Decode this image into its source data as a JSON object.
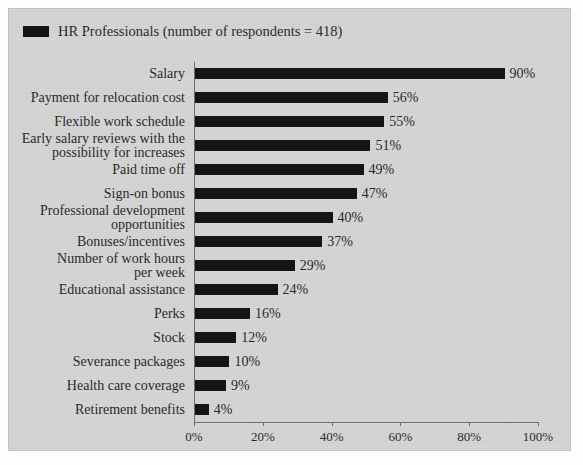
{
  "legend": {
    "swatch_color": "#141414",
    "label": "HR Professionals (number of respondents = 418)"
  },
  "chart_data": {
    "type": "bar",
    "orientation": "horizontal",
    "title": "",
    "subtitle": "",
    "xlabel": "",
    "ylabel": "",
    "xlim": [
      0,
      100
    ],
    "grid": false,
    "legend_position": "top-left",
    "xticks": [
      0,
      20,
      40,
      60,
      80,
      100
    ],
    "xticklabels": [
      "0%",
      "20%",
      "40%",
      "60%",
      "80%",
      "100%"
    ],
    "value_label_suffix": "%",
    "bar_color": "#141414",
    "categories": [
      "Salary",
      "Payment for relocation cost",
      "Flexible work schedule",
      "Early salary reviews with the\npossibility for increases",
      "Paid time off",
      "Sign-on bonus",
      "Professional development\nopportunities",
      "Bonuses/incentives",
      "Number of work hours\nper week",
      "Educational assistance",
      "Perks",
      "Stock",
      "Severance packages",
      "Health care coverage",
      "Retirement benefits"
    ],
    "values": [
      90,
      56,
      55,
      51,
      49,
      47,
      40,
      37,
      29,
      24,
      16,
      12,
      10,
      9,
      4
    ],
    "value_labels": [
      "90%",
      "56%",
      "55%",
      "51%",
      "49%",
      "47%",
      "40%",
      "37%",
      "29%",
      "24%",
      "16%",
      "12%",
      "10%",
      "9%",
      "4%"
    ],
    "series": [
      {
        "name": "HR Professionals (number of respondents = 418)",
        "values": [
          90,
          56,
          55,
          51,
          49,
          47,
          40,
          37,
          29,
          24,
          16,
          12,
          10,
          9,
          4
        ]
      }
    ]
  },
  "colors": {
    "background": "#d4d4d4",
    "page": "#fdfdfd",
    "bar": "#141414",
    "axis": "#6d6d6d",
    "text": "#2a2a2a"
  }
}
